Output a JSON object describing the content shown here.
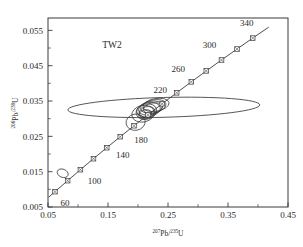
{
  "chart_data": {
    "type": "scatter",
    "title": "",
    "sample_label": "TW2",
    "xlabel": "207Pb/235U",
    "xlabel_parts": {
      "sup1": "207",
      "base1": "Pb/",
      "sup2": "235",
      "base2": "U"
    },
    "ylabel": "206Pb/238U",
    "ylabel_parts": {
      "sup1": "206",
      "base1": "Pb/",
      "sup2": "238",
      "base2": "U"
    },
    "xlim": [
      0.05,
      0.45
    ],
    "ylim": [
      0.005,
      0.0585
    ],
    "xticks": [
      0.05,
      0.15,
      0.25,
      0.35,
      0.45
    ],
    "xtick_labels": [
      "0.05",
      "0.15",
      "0.25",
      "0.35",
      "0.45"
    ],
    "xminor_ticks": [
      0.1,
      0.2,
      0.3,
      0.4
    ],
    "yticks": [
      0.005,
      0.015,
      0.025,
      0.035,
      0.045,
      0.055
    ],
    "ytick_labels": [
      "0.005",
      "0.015",
      "0.025",
      "0.035",
      "0.045",
      "0.055"
    ],
    "yminor_ticks": [
      0.01,
      0.02,
      0.03,
      0.04,
      0.05
    ],
    "grid": false,
    "legend": "none",
    "concordia_curve": {
      "name": "Concordia",
      "age_range_ma": [
        50,
        360
      ],
      "points": [
        {
          "age_ma": 50,
          "x": 0.0512,
          "y": 0.00778
        },
        {
          "age_ma": 60,
          "x": 0.0616,
          "y": 0.00934
        },
        {
          "age_ma": 80,
          "x": 0.0827,
          "y": 0.01245
        },
        {
          "age_ma": 100,
          "x": 0.104,
          "y": 0.01556
        },
        {
          "age_ma": 120,
          "x": 0.1258,
          "y": 0.01867
        },
        {
          "age_ma": 140,
          "x": 0.1479,
          "y": 0.02178
        },
        {
          "age_ma": 160,
          "x": 0.1704,
          "y": 0.02489
        },
        {
          "age_ma": 180,
          "x": 0.1933,
          "y": 0.028
        },
        {
          "age_ma": 200,
          "x": 0.2166,
          "y": 0.0311
        },
        {
          "age_ma": 220,
          "x": 0.2403,
          "y": 0.03421
        },
        {
          "age_ma": 240,
          "x": 0.2644,
          "y": 0.03732
        },
        {
          "age_ma": 260,
          "x": 0.2889,
          "y": 0.04042
        },
        {
          "age_ma": 280,
          "x": 0.3138,
          "y": 0.04352
        },
        {
          "age_ma": 300,
          "x": 0.3392,
          "y": 0.04662
        },
        {
          "age_ma": 320,
          "x": 0.365,
          "y": 0.04972
        },
        {
          "age_ma": 340,
          "x": 0.3912,
          "y": 0.05282
        },
        {
          "age_ma": 360,
          "x": 0.4179,
          "y": 0.05591
        }
      ]
    },
    "age_markers_ma": [
      60,
      80,
      100,
      120,
      140,
      160,
      180,
      200,
      220,
      240,
      260,
      280,
      300,
      320,
      340
    ],
    "age_annotations": [
      {
        "label": "60",
        "age_ma": 60
      },
      {
        "label": "100",
        "age_ma": 100
      },
      {
        "label": "140",
        "age_ma": 140
      },
      {
        "label": "180",
        "age_ma": 180
      },
      {
        "label": "220",
        "age_ma": 220
      },
      {
        "label": "260",
        "age_ma": 260
      },
      {
        "label": "300",
        "age_ma": 300
      },
      {
        "label": "340",
        "age_ma": 340
      }
    ],
    "error_ellipses": [
      {
        "id": "e-100ma",
        "cx": 0.0745,
        "cy": 0.01455,
        "rx": 0.0095,
        "ry": 0.00115,
        "angle_deg": -22
      },
      {
        "id": "e-180ma-low",
        "cx": 0.196,
        "cy": 0.029,
        "rx": 0.016,
        "ry": 0.0023,
        "angle_deg": 10
      },
      {
        "id": "e-cluster-1",
        "cx": 0.2085,
        "cy": 0.0314,
        "rx": 0.019,
        "ry": 0.00235,
        "angle_deg": 12
      },
      {
        "id": "e-cluster-2",
        "cx": 0.214,
        "cy": 0.032,
        "rx": 0.0175,
        "ry": 0.00215,
        "angle_deg": 14
      },
      {
        "id": "e-cluster-3",
        "cx": 0.2175,
        "cy": 0.03255,
        "rx": 0.02,
        "ry": 0.002,
        "angle_deg": 11
      },
      {
        "id": "e-cluster-4",
        "cx": 0.221,
        "cy": 0.033,
        "rx": 0.0205,
        "ry": 0.0019,
        "angle_deg": 13
      },
      {
        "id": "e-cluster-5",
        "cx": 0.2255,
        "cy": 0.03345,
        "rx": 0.0215,
        "ry": 0.00185,
        "angle_deg": 12
      },
      {
        "id": "e-cluster-6",
        "cx": 0.23,
        "cy": 0.0339,
        "rx": 0.022,
        "ry": 0.0018,
        "angle_deg": 10
      },
      {
        "id": "e-cluster-7",
        "cx": 0.215,
        "cy": 0.0318,
        "rx": 0.0135,
        "ry": 0.0016,
        "angle_deg": 15
      },
      {
        "id": "e-cluster-8",
        "cx": 0.212,
        "cy": 0.0312,
        "rx": 0.011,
        "ry": 0.0013,
        "angle_deg": 16
      },
      {
        "id": "e-cluster-9",
        "cx": 0.2245,
        "cy": 0.033,
        "rx": 0.016,
        "ry": 0.00145,
        "angle_deg": 11
      },
      {
        "id": "e-wide",
        "cx": 0.243,
        "cy": 0.0332,
        "rx": 0.16,
        "ry": 0.0028,
        "angle_deg": 1.5
      }
    ]
  }
}
